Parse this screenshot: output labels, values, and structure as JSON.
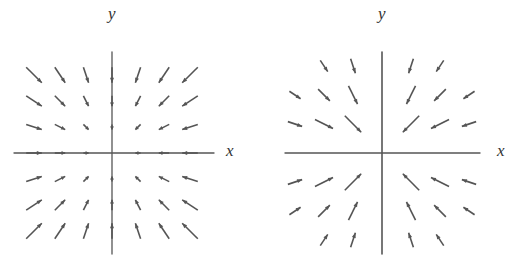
{
  "figures": [
    {
      "id": "left",
      "description": "Vector field pointing toward origin, arrow length proportional to distance",
      "xlabel": "x",
      "ylabel": "y",
      "origin": [
        112,
        153
      ],
      "spacing": 26,
      "grid": [
        -3,
        -2,
        -1,
        0,
        1,
        2,
        3
      ],
      "scale": 5.2,
      "arrow_color": "#555555",
      "axis_color": "#555555"
    },
    {
      "id": "right",
      "description": "Vector field pointing toward origin, arrow length inversely related to distance (longer near axes)",
      "xlabel": "x",
      "ylabel": "y",
      "origin": [
        382,
        153
      ],
      "spacing": 29,
      "grid": [
        -3,
        -2,
        -1,
        0,
        1,
        2,
        3
      ],
      "scale": 22,
      "arrow_color": "#555555",
      "axis_color": "#555555"
    }
  ]
}
